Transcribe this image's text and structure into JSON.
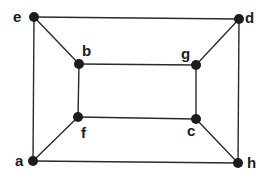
{
  "diagram": {
    "type": "graph",
    "colors": {
      "edge": "#2a2a2a",
      "node": "#1c1c1c",
      "background": "#ffffff"
    },
    "nodes": [
      {
        "id": "e",
        "label": "e",
        "x": 34,
        "y": 17,
        "lx": 13,
        "ly": 22
      },
      {
        "id": "d",
        "label": "d",
        "x": 239,
        "y": 19,
        "lx": 245,
        "ly": 23
      },
      {
        "id": "b",
        "label": "b",
        "x": 79,
        "y": 64,
        "lx": 82,
        "ly": 56
      },
      {
        "id": "g",
        "label": "g",
        "x": 196,
        "y": 65,
        "lx": 181,
        "ly": 59
      },
      {
        "id": "f",
        "label": "f",
        "x": 78,
        "y": 117,
        "lx": 81,
        "ly": 138
      },
      {
        "id": "c",
        "label": "c",
        "x": 196,
        "y": 119,
        "lx": 187,
        "ly": 136
      },
      {
        "id": "a",
        "label": "a",
        "x": 33,
        "y": 161,
        "lx": 15,
        "ly": 166
      },
      {
        "id": "h",
        "label": "h",
        "x": 238,
        "y": 163,
        "lx": 247,
        "ly": 168
      }
    ],
    "edges": [
      [
        "e",
        "d"
      ],
      [
        "d",
        "h"
      ],
      [
        "h",
        "a"
      ],
      [
        "a",
        "e"
      ],
      [
        "b",
        "g"
      ],
      [
        "g",
        "c"
      ],
      [
        "c",
        "f"
      ],
      [
        "f",
        "b"
      ],
      [
        "e",
        "b"
      ],
      [
        "d",
        "g"
      ],
      [
        "h",
        "c"
      ],
      [
        "a",
        "f"
      ]
    ]
  }
}
